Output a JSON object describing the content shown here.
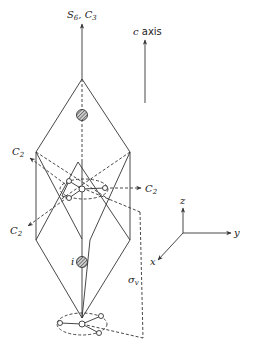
{
  "figure": {
    "type": "crystal-structure-symmetry-diagram"
  },
  "labels": {
    "main_axis": {
      "main": "S",
      "sub1": "6",
      "sep": ", ",
      "main2": "C",
      "sub2": "3"
    },
    "c_axis": {
      "italic": "c",
      "text": " axis"
    },
    "c2_upper_left": {
      "main": "C",
      "sub": "2"
    },
    "c2_right": {
      "main": "C",
      "sub": "2"
    },
    "c2_lower_left": {
      "main": "C",
      "sub": "2"
    },
    "inversion_center": "i",
    "mirror_plane": {
      "main": "σ",
      "sub": "v"
    },
    "coord_x": "x",
    "coord_y": "y",
    "coord_z": "z"
  },
  "colors": {
    "line": "#333333",
    "background": "#ffffff",
    "atom_fill": "#ffffff",
    "hatched_atom": "#555555"
  }
}
